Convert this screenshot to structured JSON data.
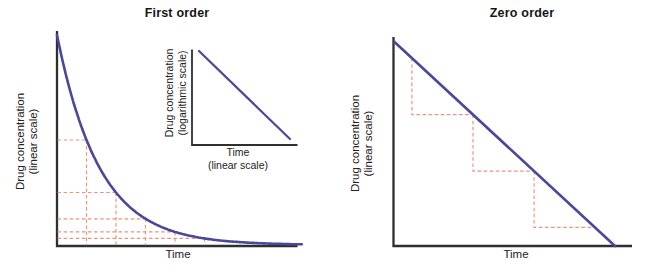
{
  "figure": {
    "charts": [
      {
        "title": "First order",
        "ylabel": {
          "line1": "Drug concentration",
          "line2": "(linear scale)"
        },
        "xlabel": "Time",
        "inset": {
          "ylabel": {
            "line1": "Drug concentration",
            "line2": "(logarithmic scale)"
          },
          "xlabel": {
            "line1": "Time",
            "line2": "(linear scale)"
          }
        }
      },
      {
        "title": "Zero order",
        "ylabel": {
          "line1": "Drug concentration",
          "line2": "(linear scale)"
        },
        "xlabel": "Time"
      }
    ]
  },
  "colors": {
    "curve_blue": "#4a489b",
    "guide_salmon": "#f0907b",
    "axis": "#2f2f2f",
    "text": "#1f1f1f",
    "background": "#ffffff"
  },
  "chart_data": [
    {
      "type": "line",
      "title": "First order",
      "xlabel": "Time",
      "ylabel": "Drug concentration (linear scale)",
      "x_unit": "half-lives (no tick labels shown)",
      "series": [
        {
          "name": "Drug concentration",
          "x": [
            0,
            1,
            2,
            3,
            4,
            5,
            6,
            7,
            8
          ],
          "values": [
            100,
            50,
            25,
            12.5,
            6.25,
            3.125,
            1.5625,
            0.78125,
            0.390625
          ]
        }
      ],
      "curve_model": "exponential decay C(t) = C0 x (1/2)^(t/t-half)",
      "axes": {
        "ticks": "none",
        "grid": false
      },
      "guides": {
        "style": "dashed salmon half-life step lines from y-axis to curve to x-axis",
        "fractions": [
          0.5,
          0.25,
          0.125,
          0.0625,
          0.03125
        ],
        "times": [
          1,
          2,
          3,
          4,
          5
        ]
      },
      "inset": {
        "type": "line",
        "xlabel": "Time (linear scale)",
        "ylabel": "Drug concentration (logarithmic scale)",
        "shape": "straight line, constant negative slope",
        "x": [
          0,
          1
        ],
        "values_log_relative": [
          1,
          0
        ]
      }
    },
    {
      "type": "line",
      "title": "Zero order",
      "xlabel": "Time",
      "ylabel": "Drug concentration (linear scale)",
      "series": [
        {
          "name": "Drug concentration",
          "x": [
            0,
            1
          ],
          "values": [
            100,
            0
          ]
        }
      ],
      "curve_model": "linear decay C(t) = C0 - k x t (constant elimination rate)",
      "axes": {
        "ticks": "none",
        "grid": false
      },
      "guides": {
        "style": "dashed salmon stair-steps: equal amount removed per equal time interval",
        "step_times": [
          0.079,
          0.356,
          0.633,
          0.909
        ],
        "steps": 3
      }
    }
  ]
}
